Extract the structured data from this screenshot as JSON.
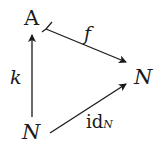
{
  "diagram": {
    "type": "commutative-triangle",
    "nodes": {
      "top_left": "A",
      "right": "N",
      "bottom_left": "N"
    },
    "arrows": [
      {
        "from": "bottom_left",
        "to": "top_left",
        "label": "k",
        "style": "plain"
      },
      {
        "from": "top_left",
        "to": "right",
        "label": "f",
        "style": "monic-tail"
      },
      {
        "from": "bottom_left",
        "to": "right",
        "label_main": "id",
        "label_sub": "N",
        "style": "plain"
      }
    ],
    "colors": {
      "ink": "#1a1a1a",
      "background": "#ffffff"
    }
  }
}
